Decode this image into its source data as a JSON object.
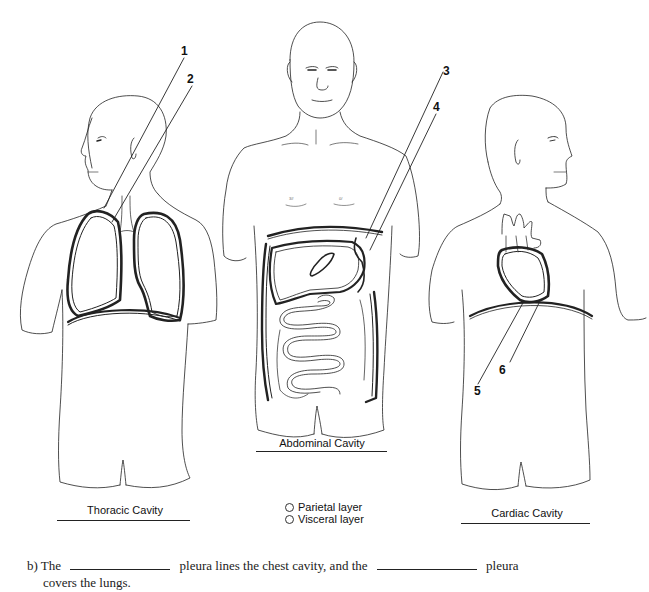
{
  "figures": [
    {
      "id": "thoracic",
      "title": "Thoracic Cavity",
      "labels": [
        "1",
        "2"
      ]
    },
    {
      "id": "abdominal",
      "title": "Abdominal Cavity",
      "labels": [
        "3",
        "4"
      ]
    },
    {
      "id": "cardiac",
      "title": "Cardiac Cavity",
      "labels": [
        "5",
        "6"
      ]
    }
  ],
  "legend": {
    "items": [
      {
        "label": "Parietal layer"
      },
      {
        "label": "Visceral layer"
      }
    ]
  },
  "question": {
    "prefix": "b)",
    "part1": "The",
    "part2": "pleura lines the chest cavity, and the",
    "part3": "pleura",
    "part4": "covers the lungs."
  },
  "colors": {
    "line": "#222222",
    "background": "#ffffff"
  }
}
